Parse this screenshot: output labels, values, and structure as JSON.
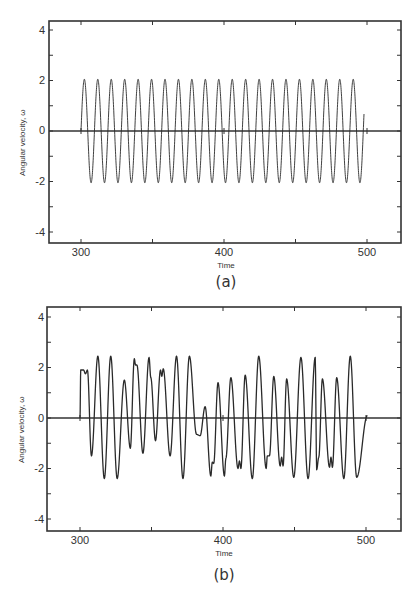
{
  "chart_data": [
    {
      "type": "line",
      "caption": "(a)",
      "title": "",
      "xlabel": "Time",
      "ylabel": "Angular velocity, ω",
      "xlim": [
        278,
        528
      ],
      "ylim": [
        -4.4,
        4.4
      ],
      "xticks": [
        300,
        400,
        500
      ],
      "yticks": [
        -4,
        -2,
        0,
        2,
        4
      ],
      "grid": false,
      "description": "Regular periodic oscillation, amplitude ≈ 2.05, period ≈ 9.4 time units, from t=300 to t≈498",
      "series": [
        {
          "name": "angular velocity",
          "generator": {
            "kind": "sine",
            "t_start": 300,
            "t_end": 498,
            "amplitude": 2.05,
            "period": 9.4,
            "phase_zero_at": 300
          }
        }
      ]
    },
    {
      "type": "line",
      "caption": "(b)",
      "title": "",
      "xlabel": "Time",
      "ylabel": "Angular velocity, ω",
      "xlim": [
        278,
        528
      ],
      "ylim": [
        -4.4,
        4.4
      ],
      "xticks": [
        300,
        400,
        500
      ],
      "yticks": [
        -4,
        -2,
        0,
        2,
        4
      ],
      "grid": false,
      "description": "Irregular (chaotic) oscillation between about -2.4 and 2.45 from t=300 to t≈501",
      "series": [
        {
          "name": "angular velocity",
          "x": [
            300,
            300.5,
            302.5,
            303.8,
            305.2,
            308,
            312.5,
            317,
            321.5,
            326,
            331,
            335.2,
            338,
            338.8,
            339.8,
            344,
            348.3,
            349.5,
            352.8,
            356.3,
            357.2,
            358.2,
            363,
            367.5,
            372,
            376.5,
            381.5,
            384,
            387.5,
            391.5,
            392.5,
            393.5,
            396.5,
            401,
            402,
            405.5,
            410.5,
            411.5,
            412.5,
            415.5,
            420.5,
            425,
            430.2,
            431,
            432.5,
            435.5,
            440,
            441,
            442,
            444.5,
            449.5,
            454.5,
            459.5,
            464.5,
            465.5,
            467,
            469.5,
            474.5,
            475.5,
            476.5,
            479.5,
            484.5,
            489,
            493.5,
            501
          ],
          "y": [
            0,
            1.9,
            1.9,
            1.75,
            1.9,
            -1.5,
            2.45,
            -2.4,
            2.45,
            -2.4,
            1.5,
            -1.2,
            2.35,
            2.1,
            2.1,
            -1.4,
            2.4,
            1.6,
            -0.9,
            1.9,
            1.65,
            1.95,
            -1.5,
            2.45,
            -2.4,
            2.45,
            -0.65,
            -0.7,
            0.45,
            -2.3,
            -1.75,
            -1.8,
            1.4,
            -2.3,
            -1.6,
            1.6,
            -2.0,
            -1.7,
            -2.0,
            1.7,
            -2.4,
            2.45,
            -2.0,
            -1.5,
            -1.5,
            1.65,
            -1.9,
            -1.55,
            -1.9,
            1.55,
            -2.35,
            2.4,
            -2.4,
            2.4,
            -2.05,
            -1.55,
            1.55,
            -1.95,
            -1.55,
            -1.95,
            1.6,
            -2.4,
            2.45,
            -2.35,
            0.1
          ]
        }
      ]
    }
  ],
  "figures": {
    "a": {
      "caption": "(a)",
      "xlabel": "Time",
      "ylabel": "Angular velocity,  ω",
      "xtick_labels": [
        "300",
        "400",
        "500"
      ],
      "ytick_labels": [
        "4",
        "2",
        "0",
        "-2",
        "-4"
      ]
    },
    "b": {
      "caption": "(b)",
      "xlabel": "Time",
      "ylabel": "Angular velocity,  ω",
      "xtick_labels": [
        "300",
        "400",
        "500"
      ],
      "ytick_labels": [
        "4",
        "2",
        "0",
        "-2",
        "-4"
      ]
    }
  },
  "style": {
    "line_color": "#2a2a2a",
    "axis_color": "#333333",
    "background": "#ffffff"
  }
}
